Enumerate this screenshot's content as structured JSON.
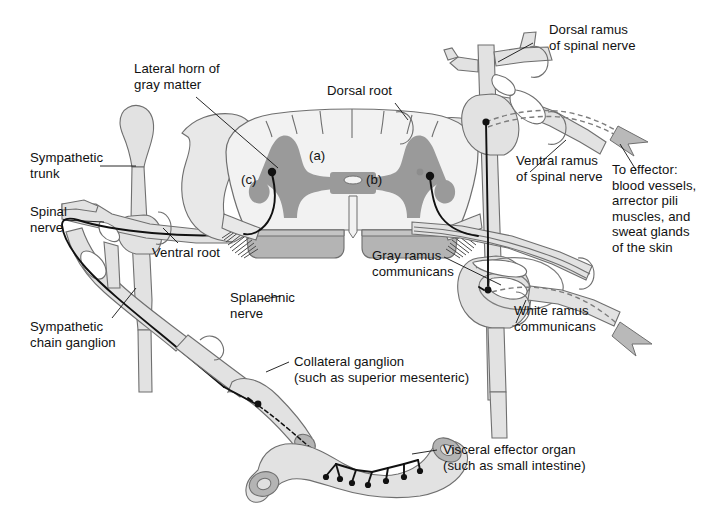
{
  "figure": {
    "background_color": "#ffffff",
    "ink_color": "#111111",
    "tissue_fill": "#e2e2e2",
    "tissue_stroke": "#6f6f6f",
    "gray_matter_color": "#9a9a9a",
    "white_matter_color": "#f2f2f2",
    "cut_surface_color": "#b4b4b4"
  },
  "labels": {
    "lateral_horn": "Lateral horn of\ngray matter",
    "dorsal_root": "Dorsal root",
    "dorsal_ramus": "Dorsal ramus\nof spinal nerve",
    "sympathetic_trunk": "Sympathetic\ntrunk",
    "spinal_nerve": "Spinal\nnerve",
    "ventral_root": "Ventral root",
    "ventral_ramus": "Ventral ramus\nof spinal nerve",
    "to_effector": "To effector:\nblood vessels,\narrector pili\nmuscles, and\nsweat glands\nof the skin",
    "gray_ramus": "Gray ramus\ncommunicans",
    "white_ramus": "White ramus\ncommunicans",
    "splanchnic_nerve": "Splanchnic\nnerve",
    "sympathetic_chain_ganglion": "Sympathetic\nchain ganglion",
    "collateral_ganglion": "Collateral ganglion\n(such as superior mesenteric)",
    "visceral_effector_organ": "Visceral effector organ\n(such as small intestine)"
  },
  "markers": {
    "a": "(a)",
    "b": "(b)",
    "c": "(c)"
  }
}
